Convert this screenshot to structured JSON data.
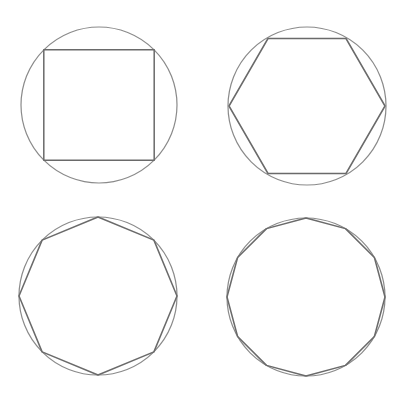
{
  "colors": {
    "circle": "#8a8a8a",
    "polygon": "#6a6a6a",
    "background": "#ffffff"
  },
  "figures": [
    {
      "name": "square-in-circle",
      "sides": 4,
      "cx": 99,
      "cy": 105,
      "r": 78,
      "start_deg": -135,
      "poly_r": 78
    },
    {
      "name": "hexagon-in-circle",
      "sides": 6,
      "cx": 307,
      "cy": 106,
      "r": 79,
      "start_deg": 180,
      "poly_r": 78
    },
    {
      "name": "octagon-in-circle",
      "sides": 8,
      "cx": 98,
      "cy": 296,
      "r": 79,
      "start_deg": -90,
      "poly_r": 79
    },
    {
      "name": "dodecagon-in-circle",
      "sides": 12,
      "cx": 306,
      "cy": 297,
      "r": 79,
      "start_deg": -90,
      "poly_r": 79
    }
  ]
}
